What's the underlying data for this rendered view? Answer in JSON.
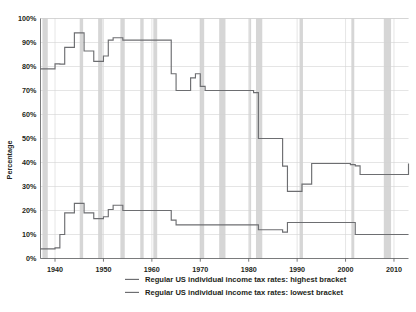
{
  "chart_data": {
    "type": "line",
    "title": "",
    "xlabel": "",
    "ylabel": "Percentage",
    "xlim": [
      1937,
      2013
    ],
    "ylim": [
      0,
      100
    ],
    "grid": true,
    "legend_position": "bottom",
    "y_ticks": [
      "0%",
      "10%",
      "20%",
      "30%",
      "40%",
      "50%",
      "60%",
      "70%",
      "80%",
      "90%",
      "100%"
    ],
    "y_tick_values": [
      0,
      10,
      20,
      30,
      40,
      50,
      60,
      70,
      80,
      90,
      100
    ],
    "x_ticks": [
      "1940",
      "1950",
      "1960",
      "1970",
      "1980",
      "1990",
      "2000",
      "2010"
    ],
    "x_tick_values": [
      1940,
      1950,
      1960,
      1970,
      1980,
      1990,
      2000,
      2010
    ],
    "line_color": "#6d6e71",
    "band_color": "#cfcfcf",
    "grid_color": "#d4d4d4",
    "series": [
      {
        "name": "Regular US individual income tax rates: highest bracket",
        "step": "post",
        "x": [
          1937,
          1938,
          1940,
          1941,
          1942,
          1944,
          1946,
          1948,
          1950,
          1951,
          1952,
          1954,
          1964,
          1965,
          1968,
          1969,
          1970,
          1971,
          1981,
          1982,
          1983,
          1984,
          1987,
          1988,
          1991,
          1993,
          2001,
          2002,
          2003,
          2013
        ],
        "values": [
          79,
          79,
          81.1,
          81,
          88,
          94,
          86.45,
          82.13,
          84.36,
          91,
          92,
          91,
          77,
          70,
          75.25,
          77,
          71.75,
          70,
          69.125,
          50,
          50,
          50,
          38.5,
          28,
          31,
          39.6,
          39.1,
          38.6,
          35,
          39.6
        ]
      },
      {
        "name": "Regular US individual income tax rates: lowest bracket",
        "step": "post",
        "x": [
          1937,
          1940,
          1941,
          1942,
          1944,
          1946,
          1948,
          1950,
          1951,
          1952,
          1954,
          1964,
          1965,
          1968,
          1969,
          1970,
          1971,
          1979,
          1982,
          1987,
          1988,
          1991,
          2001,
          2002,
          2003,
          2013
        ],
        "values": [
          4,
          4.4,
          10,
          19,
          23,
          19,
          16.6,
          17.4,
          20.4,
          22.2,
          20,
          16,
          14,
          14,
          14,
          14,
          14,
          14,
          12,
          11,
          15,
          15,
          15,
          10,
          10,
          10
        ]
      }
    ],
    "recession_bands": [
      {
        "start": 1937.4,
        "end": 1938.5
      },
      {
        "start": 1945.1,
        "end": 1945.8
      },
      {
        "start": 1948.9,
        "end": 1949.8
      },
      {
        "start": 1953.5,
        "end": 1954.4
      },
      {
        "start": 1957.6,
        "end": 1958.3
      },
      {
        "start": 1960.3,
        "end": 1961.1
      },
      {
        "start": 1969.9,
        "end": 1970.8
      },
      {
        "start": 1973.9,
        "end": 1975.2
      },
      {
        "start": 1980.1,
        "end": 1980.5
      },
      {
        "start": 1981.5,
        "end": 1982.8
      },
      {
        "start": 1990.5,
        "end": 1991.2
      },
      {
        "start": 2001.2,
        "end": 2001.8
      },
      {
        "start": 2007.9,
        "end": 2009.4
      }
    ]
  },
  "legend": {
    "items": [
      {
        "label": "Regular US individual income tax rates: highest bracket"
      },
      {
        "label": "Regular US individual income tax rates: lowest bracket"
      }
    ]
  }
}
